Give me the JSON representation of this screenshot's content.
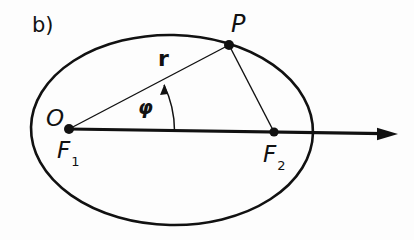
{
  "figure": {
    "panel_label": "b)",
    "colors": {
      "ink": "#111111",
      "background": "#fdfdfd"
    }
  },
  "points": {
    "P": {
      "label": "P",
      "x": 229,
      "y": 45
    },
    "O": {
      "label": "O"
    },
    "F1": {
      "label": "F",
      "subscript": "1",
      "x": 69,
      "y": 129
    },
    "F2": {
      "label": "F",
      "subscript": "2",
      "x": 274,
      "y": 132
    }
  },
  "annotations": {
    "radius_label": "r",
    "angle_label": "φ"
  },
  "ellipse": {
    "cx": 172,
    "cy": 130,
    "rx": 141,
    "ry": 95
  },
  "axis": {
    "x1": 69,
    "y1": 129,
    "x2": 397,
    "y2": 134,
    "direction": "right"
  }
}
